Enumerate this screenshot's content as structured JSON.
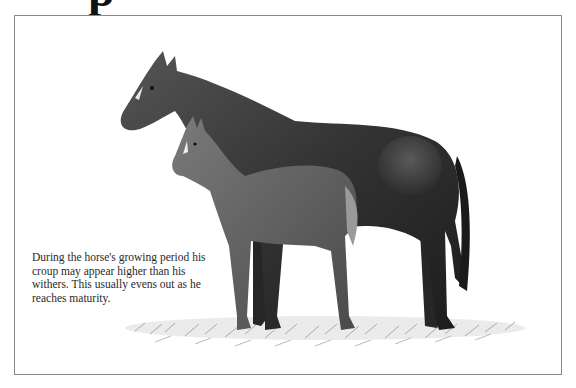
{
  "page": {
    "heading_fragment": "p"
  },
  "illustration": {
    "subject": "Mare standing with foal on grass",
    "palette": {
      "mare_body": "#3a3a3a",
      "mare_shadow": "#1e1e1e",
      "foal_body": "#5c5c5c",
      "blaze": "#e8e8e8",
      "grass": "#8c8c8c",
      "frame": "#8a8a8a"
    }
  },
  "caption": {
    "text": "During the horse's growing period his croup may appear higher than his withers. This usually evens out as he reaches maturity."
  }
}
